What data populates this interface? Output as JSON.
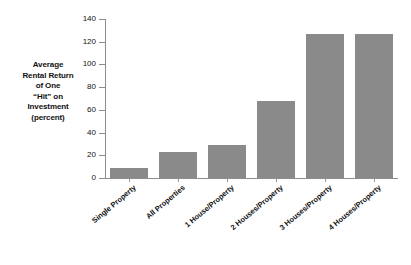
{
  "chart_data": {
    "type": "bar",
    "title": "",
    "subtitle": "",
    "xlabel": "",
    "ylabel": "Average Rental Return of One \"Hit\" on Investment (percent)",
    "ylabel_lines": [
      "Average",
      "Rental Return",
      "of One",
      "“Hit” on",
      "Investment",
      "(percent)"
    ],
    "categories": [
      "Single Property",
      "All Properties",
      "1 House/Property",
      "2 Houses/Property",
      "3 Houses/Property",
      "4 Houses/Property"
    ],
    "values": [
      9,
      23,
      29,
      68,
      127,
      127
    ],
    "ylim": [
      0,
      140
    ],
    "yticks": [
      0,
      20,
      40,
      60,
      80,
      100,
      120,
      140
    ],
    "ytick_labels": [
      "0",
      "20",
      "40",
      "60",
      "80",
      "100",
      "120",
      "140"
    ],
    "grid": false,
    "legend": null,
    "legend_position": "none",
    "bar_color": "#8a8a8a",
    "axis_color": "#8d8d8d",
    "text_color": "#111111",
    "background_color": "#ffffff"
  }
}
